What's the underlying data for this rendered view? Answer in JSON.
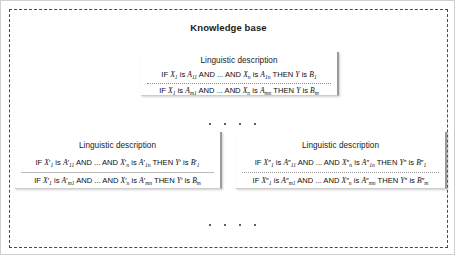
{
  "frame": {
    "title": "Knowledge base"
  },
  "cards": {
    "top": {
      "title": "Linguistic description",
      "rules": [
        {
          "if": "IF",
          "and": "AND",
          "ellipsis": "...",
          "then": "THEN",
          "is": "is",
          "x_first": "X",
          "x_first_sub": "1",
          "a_first": "A",
          "a_first_sub": "11",
          "x_last": "X",
          "x_last_sub": "n",
          "a_last": "A",
          "a_last_sub": "1n",
          "y": "Y",
          "b": "B",
          "b_sub": "1",
          "prime": ""
        },
        {
          "if": "IF",
          "and": "AND",
          "ellipsis": "...",
          "then": "THEN",
          "is": "is",
          "x_first": "X",
          "x_first_sub": "1",
          "a_first": "A",
          "a_first_sub": "m1",
          "x_last": "X",
          "x_last_sub": "n",
          "a_last": "A",
          "a_last_sub": "mn",
          "y": "Y",
          "b": "B",
          "b_sub": "m",
          "prime": ""
        }
      ]
    },
    "left": {
      "title": "Linguistic description",
      "rules": [
        {
          "if": "IF",
          "and": "AND",
          "ellipsis": "...",
          "then": "THEN",
          "is": "is",
          "x_first": "X",
          "x_first_sub": "1",
          "a_first": "A",
          "a_first_sub": "11",
          "x_last": "X",
          "x_last_sub": "n",
          "a_last": "A",
          "a_last_sub": "1n",
          "y": "Y",
          "b": "B",
          "b_sub": "1",
          "prime": "′",
          "b_prime": "′"
        },
        {
          "if": "IF",
          "and": "AND",
          "ellipsis": "...",
          "then": "THEN",
          "is": "is",
          "x_first": "X",
          "x_first_sub": "1",
          "a_first": "A",
          "a_first_sub": "m1",
          "x_last": "X",
          "x_last_sub": "n",
          "a_last": "A",
          "a_last_sub": "mn",
          "y": "Y",
          "b": "B",
          "b_sub": "m",
          "prime": "′",
          "b_prime": ""
        }
      ]
    },
    "right": {
      "title": "Linguistic description",
      "rules": [
        {
          "if": "IF",
          "and": "AND",
          "ellipsis": "...",
          "then": "THEN",
          "is": "is",
          "x_first": "X",
          "x_first_sub": "1",
          "a_first": "A",
          "a_first_sub": "11",
          "x_last": "X",
          "x_last_sub": "n",
          "a_last": "A",
          "a_last_sub": "1n",
          "y": "Y",
          "b": "B",
          "b_sub": "1",
          "prime": "″",
          "b_prime": "″"
        },
        {
          "if": "IF",
          "and": "AND",
          "ellipsis": "...",
          "then": "THEN",
          "is": "is",
          "x_first": "X",
          "x_first_sub": "1",
          "a_first": "A",
          "a_first_sub": "m1",
          "x_last": "X",
          "x_last_sub": "n",
          "a_last": "A",
          "a_last_sub": "mn",
          "y": "Y",
          "b": "B",
          "b_sub": "m",
          "prime": "″",
          "b_prime": "″"
        }
      ]
    }
  },
  "ellipsis_rows": {
    "dot_count": 4
  },
  "colors": {
    "frame_border": "#4a4a4a",
    "card_shadow": "#9a9a9a",
    "text": "#0d0d0d",
    "background": "#ffffff"
  }
}
